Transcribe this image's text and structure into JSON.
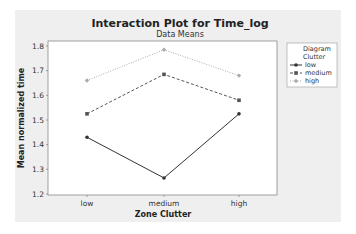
{
  "chart_data": {
    "type": "line",
    "title": "Interaction Plot for Time_log",
    "subtitle": "Data Means",
    "xlabel": "Zone Clutter",
    "ylabel": "Mean normalized time",
    "categories": [
      "low",
      "medium",
      "high"
    ],
    "yticks": [
      "1.2",
      "1.3",
      "1.4",
      "1.5",
      "1.6",
      "1.7",
      "1.8"
    ],
    "ylim": [
      1.2,
      1.8
    ],
    "grid": false,
    "legend": {
      "title_line1": "Diagram",
      "title_line2": "Clutter",
      "position": "right"
    },
    "series": [
      {
        "name": "low",
        "values": [
          1.43,
          1.265,
          1.525
        ],
        "style": "solid",
        "color": "#333333",
        "marker": "circle"
      },
      {
        "name": "medium",
        "values": [
          1.525,
          1.685,
          1.58
        ],
        "style": "dashed",
        "color": "#555555",
        "marker": "square"
      },
      {
        "name": "high",
        "values": [
          1.66,
          1.785,
          1.68
        ],
        "style": "dotted",
        "color": "#aaaaaa",
        "marker": "diamond"
      }
    ]
  }
}
